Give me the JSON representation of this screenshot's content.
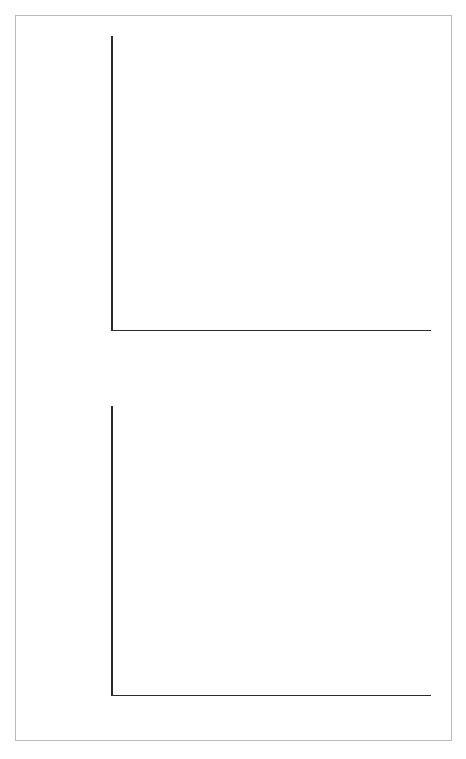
{
  "figure": {
    "background": "#ffffff",
    "frame_color": "#b9b9b9",
    "axis_color": "#2b2b2b"
  },
  "chart_data": [
    {
      "type": "bar",
      "id": "top",
      "title": "",
      "xlabel": "Nerve fiber type",
      "ylabel": "Mean response (5 sec)",
      "categories": [
        "A",
        "B",
        "C",
        "D"
      ],
      "ylim": [
        0,
        250
      ],
      "ytick_values": [
        0,
        50,
        100,
        150,
        200,
        250
      ],
      "ytick_labels": [
        "0",
        "50",
        "100",
        "150",
        "200",
        "250"
      ],
      "yminor_values": [
        25,
        75,
        125,
        175,
        225
      ],
      "grid": false,
      "legend_position": "upper-left-inside",
      "series": [
        {
          "name": "Sugar",
          "color": "#9d9d9d",
          "values": [
            110,
            17,
            14,
            27
          ]
        },
        {
          "name": "Salt",
          "color": "#bcbcbc",
          "values": [
            15,
            49,
            54,
            30
          ]
        },
        {
          "name": "Acid",
          "color": "#949494",
          "values": [
            11,
            12,
            95,
            34
          ]
        },
        {
          "name": "Quinine",
          "color": "#aeaeae",
          "values": [
            7,
            5,
            11,
            203
          ]
        }
      ]
    },
    {
      "type": "bar",
      "id": "bottom",
      "title": "",
      "xlabel": "Tuning coefficient",
      "ylabel": "Proportion of neurons",
      "bin_centers": [
        0.05,
        0.15,
        0.25,
        0.35,
        0.45,
        0.55,
        0.65,
        0.75,
        0.85,
        0.95
      ],
      "values": [
        0.01,
        0.01,
        0.02,
        0.03,
        0.04,
        0.05,
        0.16,
        0.28,
        0.24,
        0.15
      ],
      "bar_color": "#9d9d9d",
      "xlim": [
        0,
        1.0
      ],
      "ylim": [
        0,
        0.3
      ],
      "xtick_values": [
        0,
        0.1,
        0.2,
        0.3,
        0.4,
        0.5,
        0.6,
        0.7,
        0.8,
        0.9,
        1.0
      ],
      "xtick_labels": [
        "0",
        "0.1",
        "0.2",
        "0.3",
        "0.4",
        "0.5",
        "0.6",
        "0.7",
        "0.8",
        "0.9",
        "1.0"
      ],
      "ytick_values": [
        0,
        0.05,
        0.1,
        0.15,
        0.2,
        0.25,
        0.3
      ],
      "ytick_labels": [
        "0",
        "0.05",
        "0.10",
        "0.15",
        "0.20",
        "0.25",
        "0.30"
      ],
      "grid": false
    }
  ]
}
